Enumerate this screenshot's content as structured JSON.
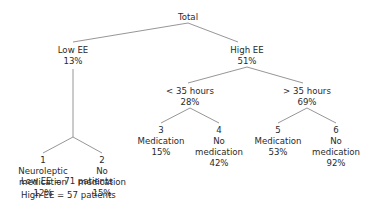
{
  "diagram": {
    "type": "tree",
    "root": {
      "id": "total",
      "label": "Total",
      "children": [
        "low-ee",
        "high-ee"
      ]
    },
    "nodes": {
      "low_ee": {
        "label": "Low EE",
        "value": "13%"
      },
      "high_ee": {
        "label": "High EE",
        "value": "51%"
      },
      "lt35": {
        "label": "< 35 hours",
        "value": "28%"
      },
      "gt35": {
        "label": "> 35 hours",
        "value": "69%"
      },
      "leaf1": {
        "number": "1",
        "lines": [
          "Neuroleptic",
          "medication"
        ],
        "value": "12%"
      },
      "leaf2": {
        "number": "2",
        "lines": [
          "No",
          "medication"
        ],
        "value": "15%"
      },
      "leaf3": {
        "number": "3",
        "lines": [
          "Medication"
        ],
        "value": "15%"
      },
      "leaf4": {
        "number": "4",
        "lines": [
          "No",
          "medication"
        ],
        "value": "42%"
      },
      "leaf5": {
        "number": "5",
        "lines": [
          "Medication"
        ],
        "value": "53%"
      },
      "leaf6": {
        "number": "6",
        "lines": [
          "No",
          "medication"
        ],
        "value": "92%"
      }
    },
    "edges": [
      [
        "Total",
        "Low EE"
      ],
      [
        "Total",
        "High EE"
      ],
      [
        "Low EE",
        "1 Neuroleptic medication"
      ],
      [
        "Low EE",
        "2 No medication"
      ],
      [
        "High EE",
        "< 35 hours"
      ],
      [
        "High EE",
        "> 35 hours"
      ],
      [
        "< 35 hours",
        "3 Medication"
      ],
      [
        "< 35 hours",
        "4 No medication"
      ],
      [
        "> 35 hours",
        "5 Medication"
      ],
      [
        "> 35 hours",
        "6 No medication"
      ]
    ],
    "legend": {
      "low_ee": "Low EE = 71 patients",
      "high_ee": "High EE = 57 patients"
    }
  }
}
